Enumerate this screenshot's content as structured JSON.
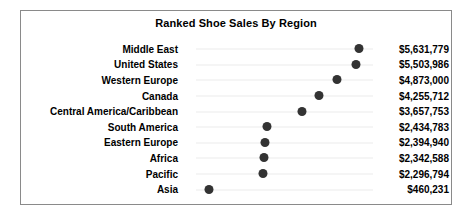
{
  "chart_data": {
    "type": "bar",
    "subtype": "dot-plot",
    "title": "Ranked Shoe Sales By Region",
    "xlabel": "",
    "ylabel": "",
    "grid": true,
    "legend": "none",
    "xlim": [
      0,
      6100000
    ],
    "categories": [
      "Middle East",
      "United States",
      "Western Europe",
      "Canada",
      "Central America/Caribbean",
      "South America",
      "Eastern Europe",
      "Africa",
      "Pacific",
      "Asia"
    ],
    "values": [
      5631779,
      5503986,
      4873000,
      4255712,
      3657753,
      2434783,
      2394940,
      2342588,
      2296794,
      460231
    ],
    "value_labels": [
      "$5,631,779",
      "$5,503,986",
      "$4,873,000",
      "$4,255,712",
      "$3,657,753",
      "$2,434,783",
      "$2,394,940",
      "$2,342,588",
      "$2,296,794",
      "$460,231"
    ],
    "marker_color": "#333333",
    "gridline_color": "#ebebeb",
    "border_color": "#8a8a8a",
    "background_color": "#ffffff"
  }
}
